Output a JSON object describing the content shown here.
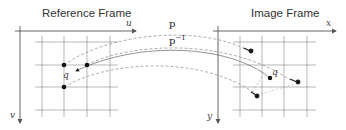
{
  "diagram": {
    "reference_frame": {
      "title": "Reference Frame",
      "x_axis_label": "u",
      "y_axis_label": "v",
      "point_label": "q",
      "grid": {
        "cols": 4,
        "rows": 4
      },
      "control_points": 3
    },
    "image_frame": {
      "title": "Image Frame",
      "x_axis_label": "x",
      "y_axis_label": "y",
      "point_label": "q",
      "grid": {
        "cols": 4,
        "rows": 4
      },
      "displacement_arrows": 3
    },
    "mappings": {
      "forward_label": "p",
      "inverse_label_base": "p",
      "inverse_label_exponent": "−1"
    },
    "colors": {
      "axis": "#555555",
      "grid": "#888888",
      "dashed_curve": "#999999",
      "solid_curve": "#777777",
      "points": "#111111"
    }
  }
}
